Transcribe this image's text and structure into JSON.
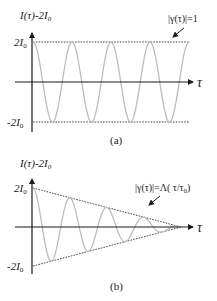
{
  "panels": [
    {
      "id": "a",
      "caption": "(a)",
      "y_axis_label": {
        "main": "I(τ)-2I",
        "sub": "0"
      },
      "x_axis_label": "τ",
      "upper_level_label": {
        "main": "2I",
        "sub": "0"
      },
      "lower_level_label": {
        "main": "-2I",
        "sub": "0"
      },
      "annotation": "|γ(τ)|=1",
      "envelope": "constant",
      "envelope_value": 1,
      "cycles_shown": 4
    },
    {
      "id": "b",
      "caption": "(b)",
      "y_axis_label": {
        "main": "I(τ)-2I",
        "sub": "0"
      },
      "x_axis_label": "τ",
      "upper_level_label": {
        "main": "2I",
        "sub": "0"
      },
      "lower_level_label": {
        "main": "-2I",
        "sub": "0"
      },
      "annotation": {
        "main": "|γ(τ)|=Λ( τ/τ",
        "sub": "0",
        "tail": ")"
      },
      "envelope": "triangular",
      "cycles_shown": 4
    }
  ],
  "colors": {
    "axis": "#1a1a1a",
    "curve": "#bdbdbd",
    "envelope": "#333333",
    "text": "#1a1a1a"
  }
}
